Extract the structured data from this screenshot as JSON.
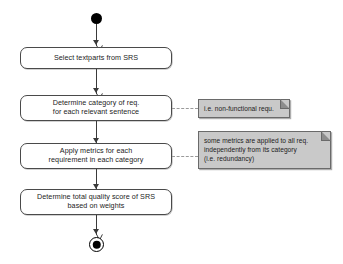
{
  "diagram": {
    "type": "uml-activity-diagram",
    "background_color": "#ffffff",
    "node_fill": "#ffffff",
    "node_stroke": "#4a4a4a",
    "note_fill": "#c9c9c9",
    "note_stroke": "#6a6a6a",
    "edge_color": "#3a3a3a",
    "link_color": "#9a9a9a"
  },
  "nodes": {
    "initial": {
      "name": "initial-node",
      "shape": "filled-circle"
    },
    "final": {
      "name": "final-node",
      "shape": "bullseye-circle"
    },
    "activities": [
      {
        "id": "select-textparts",
        "label": "Select textparts from SRS"
      },
      {
        "id": "determine-category",
        "label": "Determine category of req.\nfor each relevant sentence"
      },
      {
        "id": "apply-metrics",
        "label": "Apply metrics for each\nrequirement in each category"
      },
      {
        "id": "determine-score",
        "label": "Determine total quality score of SRS\nbased on weights"
      }
    ]
  },
  "notes": [
    {
      "id": "note-category",
      "attached_to": "determine-category",
      "text": "i.e. non-functional requ."
    },
    {
      "id": "note-metrics",
      "attached_to": "apply-metrics",
      "text": "some metrics are applied to all req.\nindependently from its category\n(i.e. redundancy)"
    }
  ],
  "edges": [
    {
      "id": "edge-initial-to-select",
      "from": "initial",
      "to": "select-textparts"
    },
    {
      "id": "edge-select-to-category",
      "from": "select-textparts",
      "to": "determine-category"
    },
    {
      "id": "edge-category-to-metrics",
      "from": "determine-category",
      "to": "apply-metrics"
    },
    {
      "id": "edge-metrics-to-score",
      "from": "apply-metrics",
      "to": "determine-score"
    },
    {
      "id": "edge-score-to-final",
      "from": "determine-score",
      "to": "final"
    }
  ]
}
